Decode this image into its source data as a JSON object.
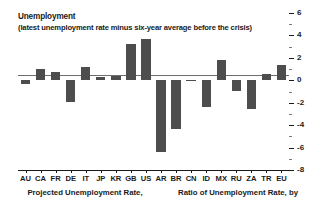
{
  "chart_data": {
    "type": "bar",
    "title": "Unemployment",
    "subtitle": "(latest unemployment rate minus six-year average before the crisis)",
    "xlabel": "",
    "ylabel": "",
    "ylim": [
      -8,
      6
    ],
    "yaxis_position": "right",
    "grid": false,
    "legend": "none",
    "bar_color": "#4d4d4d",
    "ytick_labels": [
      "6",
      "4",
      "2",
      "0",
      "-2",
      "-4",
      "-6",
      "-8"
    ],
    "ytick_values": [
      6,
      4,
      2,
      0,
      -2,
      -4,
      -6,
      -8
    ],
    "yminor_values": [
      5,
      3,
      1,
      -1,
      -3,
      -5,
      -7
    ],
    "categories": [
      "AU",
      "CA",
      "FR",
      "DE",
      "IT",
      "JP",
      "KR",
      "GB",
      "US",
      "AR",
      "BR",
      "CN",
      "ID",
      "MX",
      "RU",
      "ZA",
      "TR",
      "EU"
    ],
    "values": [
      -0.3,
      1.0,
      0.7,
      -1.9,
      1.2,
      0.3,
      0.4,
      3.2,
      3.7,
      -6.4,
      -4.3,
      0.0,
      -2.4,
      1.8,
      -1.0,
      -2.6,
      0.6,
      1.4
    ]
  },
  "captions": [
    {
      "text": "Projected Unemployment Rate,"
    },
    {
      "text": "Ratio of Unemployment Rate, by"
    }
  ]
}
